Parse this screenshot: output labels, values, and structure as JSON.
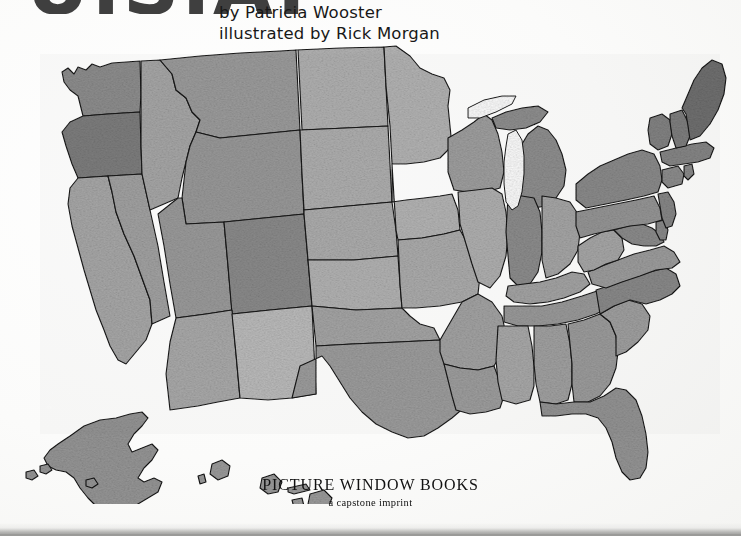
{
  "page": {
    "background_color": "#fdfdfc",
    "kind": "book-title-page"
  },
  "title": {
    "text": "U.S.A.",
    "note": "cropped-off at top edge, only letter bottoms visible",
    "color": "#3f3f3f"
  },
  "byline": {
    "author_line": "by Patricia Wooster",
    "illustrator_line": "illustrated by Rick Morgan",
    "color": "#181818"
  },
  "imprint": {
    "name": "PICTURE WINDOW BOOKS",
    "tagline": "a capstone imprint",
    "color": "#111111"
  },
  "map": {
    "name": "united-states-map",
    "style": "grayscale textured relief, black state outlines",
    "includes_insets": [
      "Alaska",
      "Hawaii"
    ],
    "outline_color": "#141414",
    "lake_color": "#ffffff",
    "states": [
      {
        "code": "WA",
        "name": "Washington",
        "shade": "#8e8e8e"
      },
      {
        "code": "OR",
        "name": "Oregon",
        "shade": "#7e7e7e"
      },
      {
        "code": "CA",
        "name": "California",
        "shade": "#a9a9a9"
      },
      {
        "code": "NV",
        "name": "Nevada",
        "shade": "#a3a3a3"
      },
      {
        "code": "ID",
        "name": "Idaho",
        "shade": "#a8a8a8"
      },
      {
        "code": "MT",
        "name": "Montana",
        "shade": "#9d9d9d"
      },
      {
        "code": "WY",
        "name": "Wyoming",
        "shade": "#9a9a9a"
      },
      {
        "code": "UT",
        "name": "Utah",
        "shade": "#9c9c9c"
      },
      {
        "code": "AZ",
        "name": "Arizona",
        "shade": "#ababab"
      },
      {
        "code": "CO",
        "name": "Colorado",
        "shade": "#8b8b8b"
      },
      {
        "code": "NM",
        "name": "New Mexico",
        "shade": "#bdbdbd"
      },
      {
        "code": "ND",
        "name": "North Dakota",
        "shade": "#b2b2b2"
      },
      {
        "code": "SD",
        "name": "South Dakota",
        "shade": "#b0b0b0"
      },
      {
        "code": "NE",
        "name": "Nebraska",
        "shade": "#aeaeae"
      },
      {
        "code": "KS",
        "name": "Kansas",
        "shade": "#b4b4b4"
      },
      {
        "code": "OK",
        "name": "Oklahoma",
        "shade": "#a6a6a6"
      },
      {
        "code": "TX",
        "name": "Texas",
        "shade": "#9e9e9e"
      },
      {
        "code": "MN",
        "name": "Minnesota",
        "shade": "#b5b5b5"
      },
      {
        "code": "IA",
        "name": "Iowa",
        "shade": "#b6b6b6"
      },
      {
        "code": "MO",
        "name": "Missouri",
        "shade": "#adadad"
      },
      {
        "code": "AR",
        "name": "Arkansas",
        "shade": "#a4a4a4"
      },
      {
        "code": "LA",
        "name": "Louisiana",
        "shade": "#9f9f9f"
      },
      {
        "code": "WI",
        "name": "Wisconsin",
        "shade": "#a0a0a0"
      },
      {
        "code": "IL",
        "name": "Illinois",
        "shade": "#b1b1b1"
      },
      {
        "code": "MI",
        "name": "Michigan",
        "shade": "#8f8f8f"
      },
      {
        "code": "IN",
        "name": "Indiana",
        "shade": "#8d8d8d"
      },
      {
        "code": "OH",
        "name": "Ohio",
        "shade": "#a7a7a7"
      },
      {
        "code": "KY",
        "name": "Kentucky",
        "shade": "#a5a5a5"
      },
      {
        "code": "TN",
        "name": "Tennessee",
        "shade": "#9b9b9b"
      },
      {
        "code": "MS",
        "name": "Mississippi",
        "shade": "#aaaaaa"
      },
      {
        "code": "AL",
        "name": "Alabama",
        "shade": "#a2a2a2"
      },
      {
        "code": "GA",
        "name": "Georgia",
        "shade": "#9d9d9d"
      },
      {
        "code": "FL",
        "name": "Florida",
        "shade": "#949494"
      },
      {
        "code": "SC",
        "name": "South Carolina",
        "shade": "#a1a1a1"
      },
      {
        "code": "NC",
        "name": "North Carolina",
        "shade": "#8a8a8a"
      },
      {
        "code": "VA",
        "name": "Virginia",
        "shade": "#9e9e9e"
      },
      {
        "code": "WV",
        "name": "West Virginia",
        "shade": "#a8a8a8"
      },
      {
        "code": "MD",
        "name": "Maryland",
        "shade": "#8c8c8c"
      },
      {
        "code": "DE",
        "name": "Delaware",
        "shade": "#8a8a8a"
      },
      {
        "code": "PA",
        "name": "Pennsylvania",
        "shade": "#969696"
      },
      {
        "code": "NJ",
        "name": "New Jersey",
        "shade": "#878787"
      },
      {
        "code": "NY",
        "name": "New York",
        "shade": "#8b8b8b"
      },
      {
        "code": "CT",
        "name": "Connecticut",
        "shade": "#8d8d8d"
      },
      {
        "code": "RI",
        "name": "Rhode Island",
        "shade": "#8a8a8a"
      },
      {
        "code": "MA",
        "name": "Massachusetts",
        "shade": "#868686"
      },
      {
        "code": "VT",
        "name": "Vermont",
        "shade": "#838383"
      },
      {
        "code": "NH",
        "name": "New Hampshire",
        "shade": "#7f7f7f"
      },
      {
        "code": "ME",
        "name": "Maine",
        "shade": "#6f6f6f"
      },
      {
        "code": "AK",
        "name": "Alaska",
        "shade": "#959595"
      },
      {
        "code": "HI",
        "name": "Hawaii",
        "shade": "#9a9a9a"
      }
    ],
    "lakes": [
      {
        "name": "Lake Michigan"
      },
      {
        "name": "Lake Superior"
      }
    ]
  }
}
